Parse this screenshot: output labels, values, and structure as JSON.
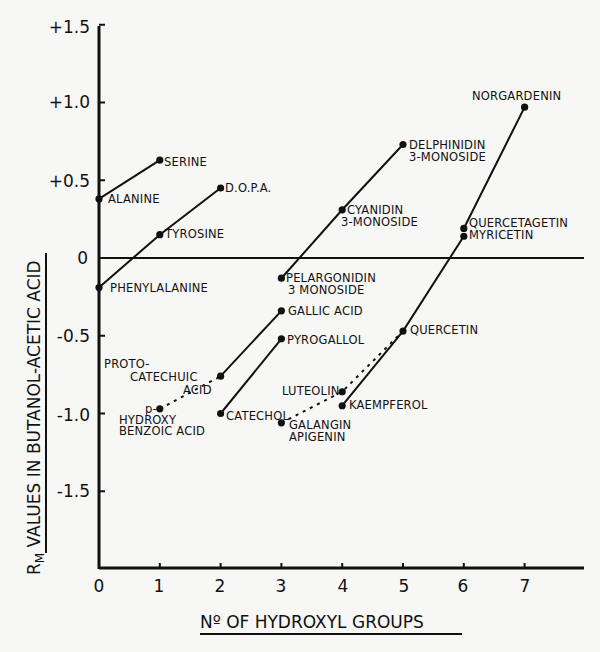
{
  "chart_data": {
    "type": "line",
    "title": "",
    "xlabel": "No OF HYDROXYL GROUPS",
    "ylabel": "RM VALUES IN BUTANOL-ACETIC ACID",
    "xlim": [
      0,
      7.5
    ],
    "ylim": [
      -2.0,
      1.5
    ],
    "x_ticks": [
      0,
      1,
      2,
      3,
      4,
      5,
      6,
      7
    ],
    "x_tick_labels": [
      "0",
      "1",
      "2",
      "3",
      "4",
      "5",
      "6",
      "7"
    ],
    "y_ticks": [
      1.5,
      1.0,
      0.5,
      0,
      -0.5,
      -1.0,
      -1.5
    ],
    "y_tick_labels": [
      "+1.5",
      "+1.0",
      "+0.5",
      "0",
      "-0.5",
      "-1.0",
      "-1.5"
    ],
    "grid": false,
    "zero_line": true,
    "points": [
      {
        "name": "ALANINE",
        "x": 0,
        "y": 0.38
      },
      {
        "name": "SERINE",
        "x": 1,
        "y": 0.63
      },
      {
        "name": "PHENYLALANINE",
        "x": 0,
        "y": -0.19
      },
      {
        "name": "TYROSINE",
        "x": 1,
        "y": 0.15
      },
      {
        "name": "D.O.P.A.",
        "x": 2,
        "y": 0.45
      },
      {
        "name": "p-HYDROXY BENZOIC ACID",
        "x": 1,
        "y": -0.97
      },
      {
        "name": "PROTO-CATECHUIC ACID",
        "x": 2,
        "y": -0.76
      },
      {
        "name": "GALLIC ACID",
        "x": 3,
        "y": -0.34
      },
      {
        "name": "CATECHOL",
        "x": 2,
        "y": -1.0
      },
      {
        "name": "PYROGALLOL",
        "x": 3,
        "y": -0.52
      },
      {
        "name": "PELARGONIDIN 3 MONOSIDE",
        "x": 3,
        "y": -0.13
      },
      {
        "name": "CYANIDIN 3-MONOSIDE",
        "x": 4,
        "y": 0.31
      },
      {
        "name": "DELPHINIDIN 3-MONOSIDE",
        "x": 5,
        "y": 0.73
      },
      {
        "name": "GALANGIN / APIGENIN",
        "x": 3,
        "y": -1.06
      },
      {
        "name": "LUTEOLIN",
        "x": 4,
        "y": -0.86
      },
      {
        "name": "KAEMPFEROL",
        "x": 4,
        "y": -0.95
      },
      {
        "name": "QUERCETIN",
        "x": 5,
        "y": -0.47
      },
      {
        "name": "MYRICETIN",
        "x": 6,
        "y": 0.14
      },
      {
        "name": "QUERCETAGETIN",
        "x": 6,
        "y": 0.19
      },
      {
        "name": "NORGARDENIN",
        "x": 7,
        "y": 0.97
      }
    ],
    "series": [
      {
        "name": "Alanine-Serine",
        "style": "solid",
        "x": [
          0,
          1
        ],
        "values": [
          0.38,
          0.63
        ]
      },
      {
        "name": "Phenylalanine-Tyrosine-DOPA",
        "style": "solid",
        "x": [
          0,
          1,
          2
        ],
        "values": [
          -0.19,
          0.15,
          0.45
        ]
      },
      {
        "name": "p-Hydroxybenzoic-Protocatechuic",
        "style": "dotted",
        "x": [
          1,
          2
        ],
        "values": [
          -0.97,
          -0.76
        ]
      },
      {
        "name": "Protocatechuic-Gallic",
        "style": "solid",
        "x": [
          2,
          3
        ],
        "values": [
          -0.76,
          -0.34
        ]
      },
      {
        "name": "Catechol-Pyrogallol",
        "style": "solid",
        "x": [
          2,
          3
        ],
        "values": [
          -1.0,
          -0.52
        ]
      },
      {
        "name": "Anthocyanidin monosides",
        "style": "solid",
        "x": [
          3,
          4,
          5
        ],
        "values": [
          -0.13,
          0.31,
          0.73
        ]
      },
      {
        "name": "Galangin-Luteolin-Quercetin",
        "style": "dotted",
        "x": [
          3,
          4,
          5
        ],
        "values": [
          -1.06,
          -0.86,
          -0.47
        ]
      },
      {
        "name": "Kaempferol-Quercetin-Myricetin",
        "style": "solid",
        "x": [
          4,
          5,
          6
        ],
        "values": [
          -0.95,
          -0.47,
          0.14
        ]
      },
      {
        "name": "Quercetagetin-Norgardenin",
        "style": "solid",
        "x": [
          6,
          7
        ],
        "values": [
          0.19,
          0.97
        ]
      }
    ]
  },
  "labels": {
    "y_axis_title": "RM VALUES IN BUTANOL-ACETIC ACID",
    "y_axis_title_rm": "R",
    "y_axis_title_sub": "M",
    "y_axis_title_rest": " VALUES IN  BUTANOL-ACETIC ACID",
    "x_axis_title": "Nº OF HYDROXYL GROUPS",
    "ticks": {
      "y": [
        "+1.5",
        "+1.0",
        "+0.5",
        "0",
        "-0.5",
        "-1.0",
        "-1.5"
      ],
      "x": [
        "0",
        "1",
        "2",
        "3",
        "4",
        "5",
        "6",
        "7"
      ]
    },
    "points": {
      "alanine": "ALANINE",
      "serine": "SERINE",
      "phenylalanine": "PHENYLALANINE",
      "tyrosine": "TYROSINE",
      "dopa": "D.O.P.A.",
      "p_hydroxy_1": "p-",
      "p_hydroxy_2": "HYDROXY",
      "p_hydroxy_3": "BENZOIC ACID",
      "proto_1": "PROTO-",
      "proto_2": "CATECHUIC",
      "proto_3": "ACID",
      "gallic": "GALLIC ACID",
      "catechol": "CATECHOL",
      "pyrogallol": "PYROGALLOL",
      "pelargonidin_1": "PELARGONIDIN",
      "pelargonidin_2": "3 MONOSIDE",
      "cyanidin_1": "CYANIDIN",
      "cyanidin_2": "3-MONOSIDE",
      "delphinidin_1": "DELPHINIDIN",
      "delphinidin_2": "3-MONOSIDE",
      "galangin": "GALANGIN",
      "apigenin": "APIGENIN",
      "luteolin": "LUTEOLIN",
      "kaempferol": "KAEMPFEROL",
      "quercetin": "QUERCETIN",
      "quercetagetin": "QUERCETAGETIN",
      "myricetin": "MYRICETIN",
      "norgardenin": "NORGARDENIN"
    }
  }
}
